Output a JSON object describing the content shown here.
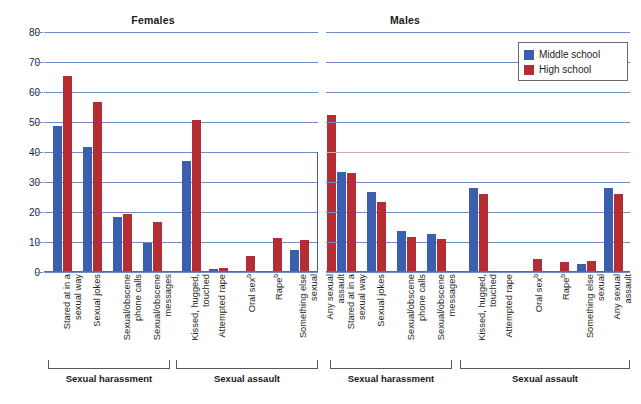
{
  "panels": [
    {
      "key": "females",
      "title": "Females"
    },
    {
      "key": "males",
      "title": "Males"
    }
  ],
  "legend": {
    "items": [
      {
        "label": "Middle school",
        "color": "#3b5fae",
        "swatch_name": "legend-swatch-middle-school"
      },
      {
        "label": "High school",
        "color": "#b52d32",
        "swatch_name": "legend-swatch-high-school"
      }
    ]
  },
  "y_axis": {
    "ticks": [
      "0",
      "10",
      "20",
      "30",
      "40",
      "50",
      "60",
      "70",
      "80"
    ],
    "min": 0,
    "max": 80,
    "step": 10
  },
  "group_brackets": [
    {
      "panel": "females",
      "label": "Sexual harassment"
    },
    {
      "panel": "females",
      "label": "Sexual assault"
    },
    {
      "panel": "males",
      "label": "Sexual harassment"
    },
    {
      "panel": "males",
      "label": "Sexual assault"
    }
  ],
  "colors": {
    "middle_school": "#3b5fae",
    "high_school": "#b52d32",
    "gridline": "#6f8fc4",
    "gridline_tinted": "#dda2b4",
    "text": "#231f20"
  },
  "chart_data": {
    "type": "bar",
    "xlabel": "",
    "ylabel": "",
    "ylim": [
      0,
      80
    ],
    "yticks": [
      0,
      10,
      20,
      30,
      40,
      50,
      60,
      70,
      80
    ],
    "grid": true,
    "legend_position": "top-right",
    "panels": [
      {
        "name": "Females",
        "groups": [
          {
            "name": "Sexual harassment",
            "categories": [
              "Stared at in a sexual way",
              "Sexual jokes",
              "Sexual/obscene phone calls",
              "Sexual/obscene messages"
            ],
            "series": [
              {
                "name": "Middle school",
                "values": [
                  48.7,
                  41.8,
                  18.2,
                  9.6
                ]
              },
              {
                "name": "High school",
                "values": [
                  65.2,
                  56.7,
                  19.2,
                  16.7
                ]
              }
            ]
          },
          {
            "name": "Sexual assault",
            "categories": [
              "Kissed, hugged, touched",
              "Attempted rape",
              "Oral sexᵇ",
              "Rapeᵇ",
              "Something else sexual",
              "Any sexual assault"
            ],
            "series": [
              {
                "name": "Middle school",
                "values": [
                  37.0,
                  0.9,
                  0.0,
                  0.0,
                  7.2,
                  40.0
                ]
              },
              {
                "name": "High school",
                "values": [
                  50.6,
                  1.3,
                  5.5,
                  11.5,
                  10.8,
                  52.3
                ]
              }
            ]
          }
        ]
      },
      {
        "name": "Males",
        "groups": [
          {
            "name": "Sexual harassment",
            "categories": [
              "Stared at in a sexual way",
              "Sexual jokes",
              "Sexual/obscene phone calls",
              "Sexual/obscene messages"
            ],
            "series": [
              {
                "name": "Middle school",
                "values": [
                  33.5,
                  26.8,
                  13.8,
                  12.8
                ]
              },
              {
                "name": "High school",
                "values": [
                  32.9,
                  23.4,
                  11.6,
                  10.9
                ]
              }
            ]
          },
          {
            "name": "Sexual assault",
            "categories": [
              "Kissed, hugged, touched",
              "Attempted rape",
              "Oral sexᵇ",
              "Rapeᵇ",
              "Something else sexual",
              "Any sexual assault"
            ],
            "series": [
              {
                "name": "Middle school",
                "values": [
                  28.0,
                  0.0,
                  0.0,
                  0.0,
                  2.6,
                  28.0
                ]
              },
              {
                "name": "High school",
                "values": [
                  26.0,
                  0.0,
                  4.2,
                  3.2,
                  3.8,
                  26.0
                ]
              }
            ]
          }
        ]
      }
    ]
  }
}
